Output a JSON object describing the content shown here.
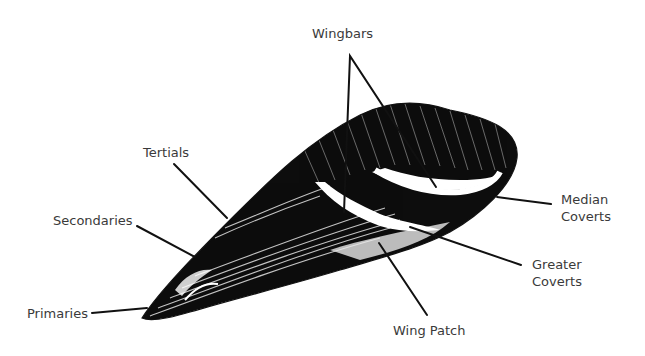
{
  "diagram": {
    "labels": {
      "wingbars": "Wingbars",
      "tertials": "Tertials",
      "secondaries": "Secondaries",
      "primaries": "Primaries",
      "median_line1": "Median",
      "median_line2": "Coverts",
      "greater_line1": "Greater",
      "greater_line2": "Coverts",
      "wing_patch": "Wing Patch"
    },
    "colors": {
      "ink": "#111111",
      "label_text": "#3a3a3a",
      "background": "#ffffff"
    }
  }
}
